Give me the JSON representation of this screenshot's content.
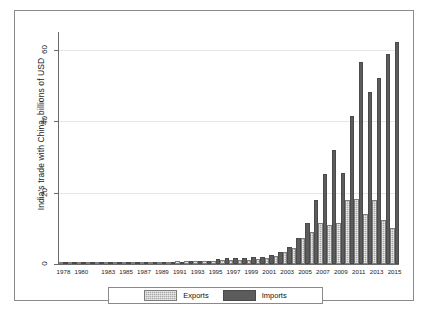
{
  "chart_data": {
    "type": "bar",
    "title": "",
    "xlabel": "",
    "ylabel": "India's trade with China, billions of USD",
    "ylim": [
      0,
      65
    ],
    "yticks": [
      0,
      20,
      40,
      60
    ],
    "ytick_labels": [
      "0",
      "20",
      "40",
      "60"
    ],
    "grid": true,
    "legend_position": "bottom",
    "categories": [
      "1978",
      "1979",
      "1980",
      "1981",
      "1982",
      "1983",
      "1984",
      "1985",
      "1986",
      "1987",
      "1988",
      "1989",
      "1990",
      "1991",
      "1992",
      "1993",
      "1994",
      "1995",
      "1996",
      "1997",
      "1998",
      "1999",
      "2000",
      "2001",
      "2002",
      "2003",
      "2004",
      "2005",
      "2006",
      "2007",
      "2008",
      "2009",
      "2010",
      "2011",
      "2012",
      "2013",
      "2014",
      "2015"
    ],
    "tick_labels_shown": [
      "1978",
      "1980",
      "1983",
      "1985",
      "1987",
      "1989",
      "1991",
      "1993",
      "1995",
      "1997",
      "1999",
      "2001",
      "2003",
      "2005",
      "2007",
      "2009",
      "2011",
      "2013",
      "2015"
    ],
    "series": [
      {
        "name": "Exports",
        "color": "#a8a8a8",
        "values": [
          0.0,
          0.0,
          0.0,
          0.0,
          0.0,
          0.0,
          0.0,
          0.0,
          0.0,
          0.1,
          0.1,
          0.1,
          0.1,
          0.2,
          0.3,
          0.3,
          0.4,
          0.4,
          0.6,
          0.7,
          0.5,
          0.5,
          0.8,
          1.0,
          1.8,
          2.9,
          4.0,
          6.8,
          8.3,
          10.8,
          10.3,
          10.9,
          17.5,
          17.6,
          13.5,
          17.3,
          11.9,
          9.6
        ]
      },
      {
        "name": "Imports",
        "color": "#5c5c5c",
        "values": [
          0.0,
          0.0,
          0.0,
          0.0,
          0.0,
          0.0,
          0.0,
          0.0,
          0.0,
          0.1,
          0.1,
          0.1,
          0.1,
          0.1,
          0.2,
          0.2,
          0.4,
          0.8,
          1.0,
          1.1,
          1.2,
          1.3,
          1.5,
          2.0,
          2.8,
          4.1,
          6.8,
          10.9,
          17.5,
          24.7,
          31.5,
          25.0,
          40.9,
          56.0,
          47.5,
          51.6,
          58.3,
          61.7
        ]
      }
    ]
  },
  "legend": {
    "exports_label": "Exports",
    "imports_label": "Imports"
  }
}
